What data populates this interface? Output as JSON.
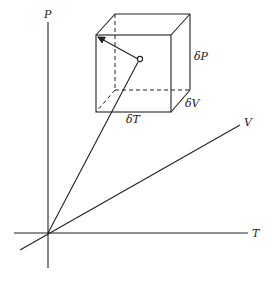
{
  "diagram": {
    "axes": {
      "p_label": "P",
      "t_label": "T",
      "v_label": "V"
    },
    "cube": {
      "delta_p_label": "δP",
      "delta_v_label": "δV",
      "delta_t_label": "δT"
    },
    "colors": {
      "line": "#222222",
      "background": "#ffffff"
    }
  }
}
